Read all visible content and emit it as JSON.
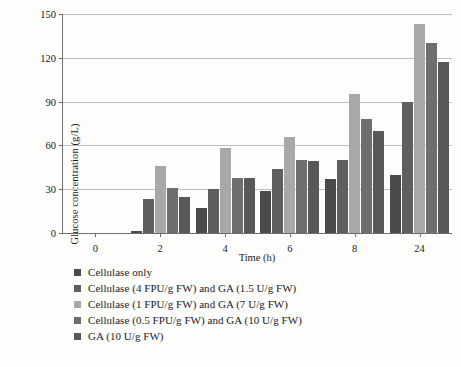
{
  "chart_data": {
    "type": "bar",
    "title": "",
    "xlabel": "Time (h)",
    "ylabel": "Glucose concentration (g/L)",
    "categories": [
      "0",
      "2",
      "4",
      "6",
      "8",
      "24"
    ],
    "ylim": [
      0,
      150
    ],
    "yticks": [
      0,
      30,
      60,
      90,
      120,
      150
    ],
    "grid": true,
    "legend_position": "below",
    "series": [
      {
        "name": "Cellulase only",
        "color": "#4a4a4a",
        "values": [
          0,
          1.5,
          17,
          29,
          37,
          40
        ]
      },
      {
        "name": "Cellulase (4 FPU/g FW) and GA (1.5 U/g FW)",
        "color": "#5f5f5f",
        "values": [
          0,
          23,
          30,
          44,
          50,
          90
        ]
      },
      {
        "name": "Cellulase (1 FPU/g FW) and GA (7 U/g FW)",
        "color": "#a8a8a8",
        "values": [
          0,
          46,
          58,
          66,
          95,
          143
        ]
      },
      {
        "name": "Cellulase (0.5 FPU/g FW) and GA (10 U/g FW)",
        "color": "#6e6e6e",
        "values": [
          0,
          31,
          38,
          50,
          78,
          130
        ]
      },
      {
        "name": "GA (10 U/g FW)",
        "color": "#585858",
        "values": [
          0,
          25,
          38,
          49,
          70,
          117
        ]
      }
    ]
  },
  "axes": {
    "y_tick_labels": [
      "0",
      "30",
      "60",
      "90",
      "120",
      "150"
    ],
    "x_tick_labels": [
      "0",
      "2",
      "4",
      "6",
      "8",
      "24"
    ],
    "y_axis_title": "Glucose concentration (g/L)",
    "x_axis_title": "Time (h)"
  },
  "legend": {
    "items": [
      {
        "label": "Cellulase only",
        "color": "#4a4a4a"
      },
      {
        "label": "Cellulase (4 FPU/g FW) and GA (1.5 U/g FW)",
        "color": "#5f5f5f"
      },
      {
        "label": "Cellulase (1 FPU/g FW) and GA (7 U/g FW)",
        "color": "#a8a8a8"
      },
      {
        "label": "Cellulase (0.5 FPU/g FW) and GA (10 U/g FW)",
        "color": "#6e6e6e"
      },
      {
        "label": "GA (10 U/g FW)",
        "color": "#585858"
      }
    ]
  }
}
